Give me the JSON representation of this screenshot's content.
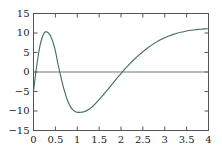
{
  "chart_data": {
    "type": "line",
    "title": "",
    "xlabel": "",
    "ylabel": "",
    "xlim": [
      0,
      4
    ],
    "ylim": [
      -15,
      15
    ],
    "grid": false,
    "legend": null,
    "zero_line": true,
    "axis_color": "#555555",
    "zero_line_color": "#777777",
    "series": [
      {
        "name": "curve",
        "color": "#3f6b66",
        "linewidth": 1.1,
        "x": [
          0.0,
          0.05,
          0.1,
          0.15,
          0.2,
          0.25,
          0.28,
          0.3,
          0.35,
          0.4,
          0.45,
          0.5,
          0.56,
          0.6,
          0.65,
          0.7,
          0.75,
          0.8,
          0.85,
          0.9,
          0.95,
          1.0,
          1.05,
          1.1,
          1.12,
          1.15,
          1.2,
          1.25,
          1.3,
          1.35,
          1.4,
          1.5,
          1.6,
          1.7,
          1.8,
          1.9,
          2.0,
          2.1,
          2.15,
          2.2,
          2.3,
          2.4,
          2.5,
          2.6,
          2.7,
          2.8,
          2.9,
          3.0,
          3.1,
          3.2,
          3.3,
          3.4,
          3.5,
          3.6,
          3.7,
          3.8,
          3.9,
          4.0
        ],
        "y": [
          -5.0,
          -0.4,
          3.6,
          6.8,
          8.9,
          10.1,
          10.3,
          10.3,
          9.9,
          9.0,
          7.5,
          5.4,
          2.0,
          0.0,
          -2.4,
          -4.6,
          -6.4,
          -7.9,
          -9.0,
          -9.7,
          -10.1,
          -10.3,
          -10.35,
          -10.3,
          -10.28,
          -10.2,
          -10.0,
          -9.7,
          -9.3,
          -8.85,
          -8.3,
          -7.1,
          -5.8,
          -4.45,
          -3.1,
          -1.7,
          -0.4,
          0.9,
          1.5,
          2.1,
          3.2,
          4.25,
          5.2,
          6.1,
          6.9,
          7.6,
          8.25,
          8.8,
          9.25,
          9.65,
          10.0,
          10.25,
          10.5,
          10.7,
          10.85,
          10.95,
          11.05,
          11.1
        ]
      }
    ],
    "xticks": [
      {
        "value": 0,
        "label": "0"
      },
      {
        "value": 0.5,
        "label": "0.5"
      },
      {
        "value": 1,
        "label": "1"
      },
      {
        "value": 1.5,
        "label": "1.5"
      },
      {
        "value": 2,
        "label": "2"
      },
      {
        "value": 2.5,
        "label": "2.5"
      },
      {
        "value": 3,
        "label": "3"
      },
      {
        "value": 3.5,
        "label": "3.5"
      },
      {
        "value": 4,
        "label": "4"
      }
    ],
    "yticks": [
      {
        "value": 15,
        "label": "15"
      },
      {
        "value": 10,
        "label": "10"
      },
      {
        "value": 5,
        "label": "5"
      },
      {
        "value": 0,
        "label": "0"
      },
      {
        "value": -5,
        "label": "−5"
      },
      {
        "value": -10,
        "label": "−10"
      },
      {
        "value": -15,
        "label": "−15"
      }
    ]
  }
}
